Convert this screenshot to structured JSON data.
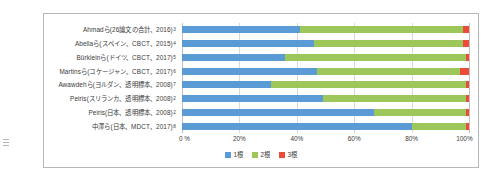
{
  "chart_data": {
    "type": "bar",
    "orientation": "horizontal",
    "stacked": "percent",
    "title": "",
    "xlabel": "",
    "ylabel": "",
    "xlim": [
      0,
      100
    ],
    "grid": true,
    "legend_position": "bottom",
    "xticks": [
      "0 %",
      "20%",
      "40%",
      "60%",
      "80%",
      "100%"
    ],
    "xtick_values": [
      0,
      20,
      40,
      60,
      80,
      100
    ],
    "series": [
      {
        "name": "1根",
        "color": "#5b9bd5",
        "values": [
          41,
          46,
          36,
          47,
          31,
          49,
          67,
          80
        ]
      },
      {
        "name": "2根",
        "color": "#9dc75b",
        "values": [
          57,
          52,
          63,
          50,
          68,
          50,
          32,
          19
        ]
      },
      {
        "name": "3根",
        "color": "#ec4b3a",
        "values": [
          2,
          2,
          1,
          3,
          1,
          1,
          1,
          1
        ]
      }
    ],
    "categories": [
      {
        "label": "Ahmadら(26論文の合計、2016)",
        "note": "3"
      },
      {
        "label": "Abellaら(スペイン、CBCT、2015)",
        "note": "4"
      },
      {
        "label": "Bürkleinら(ドイツ、CBCT、2017)",
        "note": "5"
      },
      {
        "label": "Martinsら(コケージャン、CBCT、2017)",
        "note": "6"
      },
      {
        "label": "Awawdehら(ヨルダン、透明標本、2008)",
        "note": "7"
      },
      {
        "label": "Peiris(スリランカ、透明標本、2008)",
        "note": "2"
      },
      {
        "label": "Peiris(日本、透明標本、2008)",
        "note": "2"
      },
      {
        "label": "中澤ら(日本、MDCT、2017)",
        "note": "8"
      }
    ]
  }
}
